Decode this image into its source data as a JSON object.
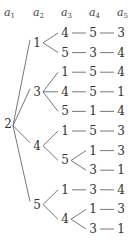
{
  "headers": [
    {
      "base": "a",
      "sub": "1"
    },
    {
      "base": "a",
      "sub": "2"
    },
    {
      "base": "a",
      "sub": "3"
    },
    {
      "base": "a",
      "sub": "4"
    },
    {
      "base": "a",
      "sub": "5"
    }
  ],
  "tree": {
    "value": "2",
    "children": [
      {
        "value": "1",
        "children": [
          {
            "value": "4",
            "children": [
              {
                "value": "5",
                "children": [
                  {
                    "value": "3"
                  }
                ]
              }
            ]
          },
          {
            "value": "5",
            "children": [
              {
                "value": "3",
                "children": [
                  {
                    "value": "4"
                  }
                ]
              }
            ]
          }
        ]
      },
      {
        "value": "3",
        "children": [
          {
            "value": "1",
            "children": [
              {
                "value": "5",
                "children": [
                  {
                    "value": "4"
                  }
                ]
              }
            ]
          },
          {
            "value": "4",
            "children": [
              {
                "value": "5",
                "children": [
                  {
                    "value": "1"
                  }
                ]
              }
            ]
          },
          {
            "value": "5",
            "children": [
              {
                "value": "1",
                "children": [
                  {
                    "value": "4"
                  }
                ]
              }
            ]
          }
        ]
      },
      {
        "value": "4",
        "children": [
          {
            "value": "1",
            "children": [
              {
                "value": "5",
                "children": [
                  {
                    "value": "3"
                  }
                ]
              }
            ]
          },
          {
            "value": "5",
            "children": [
              {
                "value": "1",
                "children": [
                  {
                    "value": "3"
                  }
                ]
              },
              {
                "value": "3",
                "children": [
                  {
                    "value": "1"
                  }
                ]
              }
            ]
          }
        ]
      },
      {
        "value": "5",
        "children": [
          {
            "value": "1",
            "children": [
              {
                "value": "3",
                "children": [
                  {
                    "value": "4"
                  }
                ]
              }
            ]
          },
          {
            "value": "4",
            "children": [
              {
                "value": "1",
                "children": [
                  {
                    "value": "3"
                  }
                ]
              },
              {
                "value": "3",
                "children": [
                  {
                    "value": "1"
                  }
                ]
              }
            ]
          }
        ]
      }
    ]
  }
}
